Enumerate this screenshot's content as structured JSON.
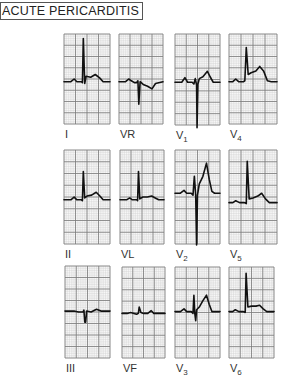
{
  "title": "ACUTE PERICARDITIS",
  "grid": {
    "major_color": "#7a7a7a",
    "minor_color": "#cfcfcf",
    "trace_color": "#111111",
    "major_cols": 4,
    "major_rows": 8
  },
  "leads": [
    {
      "id": "I",
      "label": "I",
      "sub": "",
      "x": 64,
      "y": 34,
      "w": 46,
      "h": 90,
      "baseline": 0.53,
      "trace": [
        [
          0,
          0
        ],
        [
          0.15,
          0
        ],
        [
          0.22,
          -0.03
        ],
        [
          0.28,
          0
        ],
        [
          0.38,
          0
        ],
        [
          0.4,
          0.01
        ],
        [
          0.42,
          -0.48
        ],
        [
          0.45,
          0.02
        ],
        [
          0.48,
          -0.06
        ],
        [
          0.58,
          -0.05
        ],
        [
          0.68,
          -0.08
        ],
        [
          0.78,
          -0.04
        ],
        [
          0.85,
          0
        ],
        [
          1,
          0
        ]
      ]
    },
    {
      "id": "VR",
      "label": "VR",
      "sub": "",
      "x": 119,
      "y": 34,
      "w": 44,
      "h": 90,
      "baseline": 0.53,
      "trace": [
        [
          0,
          0
        ],
        [
          0.15,
          0
        ],
        [
          0.22,
          -0.03
        ],
        [
          0.28,
          -0.01
        ],
        [
          0.35,
          0.01
        ],
        [
          0.4,
          0.01
        ],
        [
          0.43,
          -0.01
        ],
        [
          0.45,
          0.25
        ],
        [
          0.48,
          0
        ],
        [
          0.55,
          0.03
        ],
        [
          0.65,
          0.05
        ],
        [
          0.75,
          0.08
        ],
        [
          0.83,
          0.02
        ],
        [
          1,
          0
        ]
      ]
    },
    {
      "id": "V1",
      "label": "V",
      "sub": "1",
      "x": 175,
      "y": 34,
      "w": 45,
      "h": 91,
      "baseline": 0.53,
      "trace": [
        [
          0,
          0
        ],
        [
          0.15,
          0
        ],
        [
          0.22,
          -0.05
        ],
        [
          0.28,
          0
        ],
        [
          0.38,
          0
        ],
        [
          0.42,
          0.02
        ],
        [
          0.45,
          -0.04
        ],
        [
          0.48,
          0.03
        ],
        [
          0.49,
          0.5
        ],
        [
          0.51,
          0.02
        ],
        [
          0.54,
          -0.04
        ],
        [
          0.62,
          -0.06
        ],
        [
          0.72,
          -0.12
        ],
        [
          0.78,
          -0.06
        ],
        [
          0.85,
          0
        ],
        [
          1,
          0
        ]
      ]
    },
    {
      "id": "V4",
      "label": "V",
      "sub": "4",
      "x": 229,
      "y": 34,
      "w": 48,
      "h": 90,
      "baseline": 0.53,
      "trace": [
        [
          0,
          0
        ],
        [
          0.08,
          0
        ],
        [
          0.14,
          -0.03
        ],
        [
          0.2,
          0
        ],
        [
          0.3,
          0
        ],
        [
          0.33,
          -0.01
        ],
        [
          0.36,
          -0.38
        ],
        [
          0.4,
          -0.08
        ],
        [
          0.46,
          -0.1
        ],
        [
          0.56,
          -0.12
        ],
        [
          0.64,
          -0.17
        ],
        [
          0.72,
          -0.12
        ],
        [
          0.8,
          -0.01
        ],
        [
          0.88,
          0
        ],
        [
          1,
          0
        ]
      ]
    },
    {
      "id": "II",
      "label": "II",
      "sub": "",
      "x": 64,
      "y": 150,
      "w": 46,
      "h": 94,
      "baseline": 0.53,
      "trace": [
        [
          0,
          0
        ],
        [
          0.15,
          0
        ],
        [
          0.22,
          -0.03
        ],
        [
          0.28,
          0
        ],
        [
          0.38,
          0
        ],
        [
          0.4,
          0.01
        ],
        [
          0.42,
          -0.3
        ],
        [
          0.45,
          -0.02
        ],
        [
          0.5,
          -0.04
        ],
        [
          0.6,
          -0.05
        ],
        [
          0.7,
          -0.08
        ],
        [
          0.78,
          -0.04
        ],
        [
          0.85,
          0
        ],
        [
          1,
          0
        ]
      ]
    },
    {
      "id": "VL",
      "label": "VL",
      "sub": "",
      "x": 120,
      "y": 150,
      "w": 44,
      "h": 94,
      "baseline": 0.53,
      "trace": [
        [
          0,
          0
        ],
        [
          0.15,
          0
        ],
        [
          0.22,
          -0.02
        ],
        [
          0.28,
          0
        ],
        [
          0.38,
          0
        ],
        [
          0.4,
          0.01
        ],
        [
          0.42,
          -0.3
        ],
        [
          0.45,
          -0.01
        ],
        [
          0.52,
          -0.03
        ],
        [
          0.62,
          -0.03
        ],
        [
          0.72,
          -0.04
        ],
        [
          0.8,
          -0.02
        ],
        [
          0.88,
          0
        ],
        [
          1,
          0
        ]
      ]
    },
    {
      "id": "V2",
      "label": "V",
      "sub": "2",
      "x": 175,
      "y": 150,
      "w": 45,
      "h": 94,
      "baseline": 0.46,
      "trace": [
        [
          0,
          0
        ],
        [
          0.12,
          0
        ],
        [
          0.2,
          -0.03
        ],
        [
          0.26,
          0
        ],
        [
          0.36,
          0
        ],
        [
          0.4,
          0.02
        ],
        [
          0.43,
          -0.18
        ],
        [
          0.46,
          0.02
        ],
        [
          0.48,
          0.55
        ],
        [
          0.5,
          0.02
        ],
        [
          0.54,
          -0.1
        ],
        [
          0.62,
          -0.18
        ],
        [
          0.7,
          -0.32
        ],
        [
          0.76,
          -0.15
        ],
        [
          0.82,
          -0.02
        ],
        [
          0.88,
          0
        ],
        [
          1,
          0
        ]
      ]
    },
    {
      "id": "V5",
      "label": "V",
      "sub": "5",
      "x": 229,
      "y": 150,
      "w": 48,
      "h": 94,
      "baseline": 0.56,
      "trace": [
        [
          0,
          0
        ],
        [
          0.08,
          0
        ],
        [
          0.14,
          -0.02
        ],
        [
          0.22,
          0
        ],
        [
          0.32,
          0
        ],
        [
          0.36,
          0.01
        ],
        [
          0.38,
          -0.44
        ],
        [
          0.42,
          -0.04
        ],
        [
          0.5,
          -0.05
        ],
        [
          0.6,
          -0.07
        ],
        [
          0.68,
          -0.1
        ],
        [
          0.76,
          -0.04
        ],
        [
          0.84,
          0
        ],
        [
          1,
          0
        ]
      ]
    },
    {
      "id": "III",
      "label": "III",
      "sub": "",
      "x": 65,
      "y": 266,
      "w": 45,
      "h": 92,
      "baseline": 0.49,
      "trace": [
        [
          0,
          0
        ],
        [
          0.2,
          0
        ],
        [
          0.3,
          0.01
        ],
        [
          0.4,
          0.01
        ],
        [
          0.42,
          -0.01
        ],
        [
          0.44,
          0.12
        ],
        [
          0.46,
          0.12
        ],
        [
          0.48,
          0
        ],
        [
          0.58,
          0.01
        ],
        [
          0.7,
          -0.02
        ],
        [
          0.8,
          0
        ],
        [
          1,
          0
        ]
      ]
    },
    {
      "id": "VF",
      "label": "VF",
      "sub": "",
      "x": 122,
      "y": 267,
      "w": 43,
      "h": 91,
      "baseline": 0.51,
      "trace": [
        [
          0,
          0
        ],
        [
          0.12,
          0
        ],
        [
          0.2,
          -0.01
        ],
        [
          0.28,
          0
        ],
        [
          0.34,
          0.01
        ],
        [
          0.38,
          0
        ],
        [
          0.4,
          -0.07
        ],
        [
          0.44,
          -0.01
        ],
        [
          0.5,
          0
        ],
        [
          0.6,
          0
        ],
        [
          0.68,
          -0.03
        ],
        [
          0.74,
          0
        ],
        [
          0.84,
          0
        ],
        [
          1,
          0
        ]
      ]
    },
    {
      "id": "V3",
      "label": "V",
      "sub": "3",
      "x": 175,
      "y": 267,
      "w": 45,
      "h": 91,
      "baseline": 0.49,
      "trace": [
        [
          0,
          0
        ],
        [
          0.12,
          0
        ],
        [
          0.2,
          -0.03
        ],
        [
          0.26,
          0
        ],
        [
          0.36,
          0
        ],
        [
          0.4,
          0.02
        ],
        [
          0.42,
          -0.18
        ],
        [
          0.44,
          0.02
        ],
        [
          0.46,
          0.1
        ],
        [
          0.48,
          -0.02
        ],
        [
          0.54,
          -0.05
        ],
        [
          0.62,
          -0.12
        ],
        [
          0.7,
          -0.18
        ],
        [
          0.76,
          -0.08
        ],
        [
          0.82,
          0
        ],
        [
          1,
          0
        ]
      ]
    },
    {
      "id": "V6",
      "label": "V",
      "sub": "6",
      "x": 229,
      "y": 267,
      "w": 45,
      "h": 91,
      "baseline": 0.49,
      "trace": [
        [
          0,
          0
        ],
        [
          0.08,
          0
        ],
        [
          0.14,
          -0.02
        ],
        [
          0.22,
          0
        ],
        [
          0.32,
          0
        ],
        [
          0.36,
          0.01
        ],
        [
          0.38,
          -0.42
        ],
        [
          0.42,
          -0.05
        ],
        [
          0.5,
          -0.06
        ],
        [
          0.6,
          -0.06
        ],
        [
          0.68,
          -0.07
        ],
        [
          0.76,
          -0.03
        ],
        [
          0.84,
          0
        ],
        [
          1,
          0
        ]
      ]
    }
  ]
}
